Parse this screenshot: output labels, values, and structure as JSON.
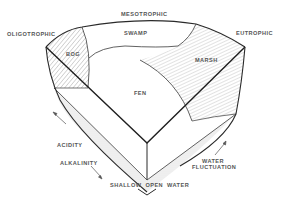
{
  "diagram": {
    "type": "wetland-classification-block",
    "trophic_labels": {
      "left": "OLIGOTROPHIC",
      "top": "MESOTROPHIC",
      "right": "EUTROPHIC"
    },
    "zones": {
      "bog": "BOG",
      "swamp": "SWAMP",
      "marsh": "MARSH",
      "fen": "FEN"
    },
    "gradients": {
      "acidity": "ACIDITY",
      "alkalinity": "ALKALINITY",
      "water_line1": "WATER",
      "water_line2": "FLUCTUATION",
      "shallow_open_water": "SHALLOW  OPEN  WATER"
    },
    "colors": {
      "line": "#2a2a2a",
      "hatch": "#777777",
      "stipple": "#efefef",
      "text": "#555555"
    }
  }
}
